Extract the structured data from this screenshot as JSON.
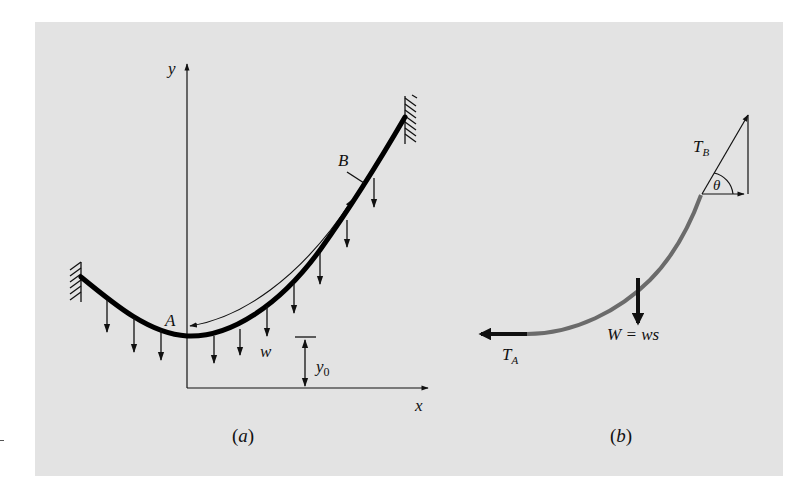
{
  "figure": {
    "panel_a": {
      "caption_open": "(",
      "caption_letter": "a",
      "caption_close": ")",
      "axis_x_label": "x",
      "axis_y_label": "y",
      "point_A_label": "A",
      "point_B_label": "B",
      "load_label": "w",
      "offset_label": "y",
      "offset_subscript": "0",
      "cable_color": "#000000",
      "load_arrow_count": 10
    },
    "panel_b": {
      "caption_open": "(",
      "caption_letter": "b",
      "caption_close": ")",
      "tension_A_label": "T",
      "tension_A_subscript": "A",
      "tension_B_label": "T",
      "tension_B_subscript": "B",
      "angle_label": "θ",
      "weight_label": "W = ws",
      "cable_color": "#6b6b6b"
    },
    "background_color": "#e3e3e3"
  }
}
